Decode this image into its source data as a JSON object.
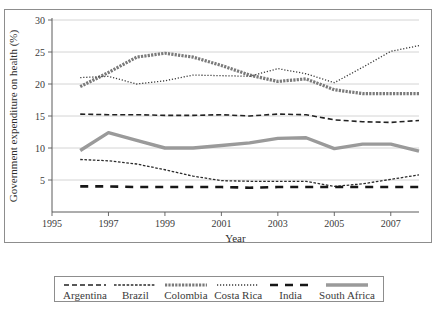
{
  "figure": {
    "caption_partial": "",
    "frame_color": "#8d8d8d"
  },
  "chart_data": {
    "type": "line",
    "title": "",
    "xlabel": "Year",
    "ylabel": "Government expenditure on health (%)",
    "xlim": [
      1995,
      2008
    ],
    "ylim": [
      0,
      30
    ],
    "xticks": [
      1995,
      1997,
      1999,
      2001,
      2003,
      2005,
      2007
    ],
    "xtick_labels": [
      "1995",
      "1997",
      "1999",
      "2001",
      "2003",
      "2005",
      "2007"
    ],
    "yticks": [
      5,
      10,
      15,
      20,
      25,
      30
    ],
    "ytick_labels": [
      "5",
      "10",
      "15",
      "20",
      "25",
      "30"
    ],
    "grid": "horizontal",
    "legend_position": "bottom-outside",
    "x": [
      1996,
      1997,
      1998,
      1999,
      2000,
      2001,
      2002,
      2003,
      2004,
      2005,
      2006,
      2007,
      2008
    ],
    "series": [
      {
        "name": "Argentina",
        "style": "dashed",
        "color": "#222222",
        "width": 1.6,
        "dash": "5,3",
        "values": [
          15.3,
          15.2,
          15.2,
          15.1,
          15.1,
          15.2,
          15.0,
          15.3,
          15.2,
          14.4,
          14.1,
          14.0,
          14.3
        ]
      },
      {
        "name": "Brazil",
        "style": "fine-dashed",
        "color": "#2b2b2b",
        "width": 1.3,
        "dash": "2.6,1.6",
        "values": [
          8.2,
          8.0,
          7.5,
          6.6,
          5.6,
          4.9,
          4.8,
          4.8,
          4.8,
          4.0,
          4.4,
          5.1,
          5.8
        ]
      },
      {
        "name": "Colombia",
        "style": "thick-hatched",
        "color": "#7a7a7a",
        "width": 3.2,
        "dash": "2.2,1.2",
        "values": [
          19.6,
          21.8,
          24.2,
          24.8,
          24.2,
          22.9,
          21.4,
          20.4,
          20.8,
          19.1,
          18.5,
          18.5,
          18.5
        ]
      },
      {
        "name": "Costa Rica",
        "style": "dotted",
        "color": "#3a3a3a",
        "width": 1.3,
        "dash": "1.2,1.8",
        "values": [
          21.0,
          21.2,
          20.0,
          20.5,
          21.4,
          21.3,
          21.2,
          22.4,
          21.6,
          20.2,
          22.6,
          25.1,
          26.0
        ]
      },
      {
        "name": "India",
        "style": "long-dash",
        "color": "#161616",
        "width": 2.6,
        "dash": "8,7",
        "values": [
          4.0,
          4.0,
          3.9,
          3.9,
          3.9,
          3.9,
          3.8,
          3.9,
          3.9,
          3.9,
          3.9,
          3.9,
          3.9
        ]
      },
      {
        "name": "South Africa",
        "style": "thick-solid",
        "color": "#9a9a9a",
        "width": 3.4,
        "dash": "",
        "values": [
          9.6,
          12.4,
          11.2,
          10.0,
          10.0,
          10.4,
          10.8,
          11.5,
          11.6,
          9.9,
          10.6,
          10.6,
          9.5
        ]
      }
    ]
  }
}
